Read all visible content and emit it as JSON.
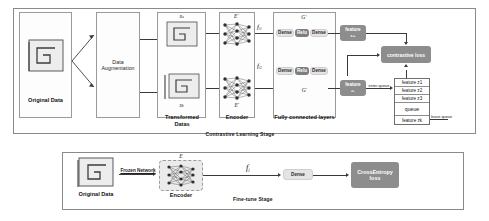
{
  "top_stage": {
    "stage_label": "Contrastive Learning Stage",
    "original_data_label": "Original Data",
    "augmentation_label_line1": "Data",
    "augmentation_label_line2": "Augmentation",
    "transformed_label_line1": "Transformed",
    "transformed_label_line2": "Datas",
    "sample_top_symbol": "x",
    "sample_top_subscript": "a",
    "sample_bottom_symbol": "x",
    "sample_bottom_subscript": "b",
    "encoder_label": "Encoder",
    "encoder_top_symbol": "E",
    "encoder_top_superscript": "+",
    "encoder_bottom_symbol": "E",
    "encoder_bottom_superscript": "-",
    "fc_label": "Fully connected layers",
    "head_top_symbol": "G",
    "head_top_superscript": "+",
    "head_bottom_symbol": "G",
    "head_bottom_superscript": "-",
    "feature_top_symbol": "f",
    "feature_top_subscript": "i1",
    "feature_bottom_symbol": "f",
    "feature_bottom_subscript": "i2",
    "mlp_top": [
      "Dense",
      "Relu",
      "Dense"
    ],
    "mlp_bottom": [
      "Dense",
      "Relu",
      "Dense"
    ],
    "feature_pos_line1": "feature",
    "feature_pos_line2": "z+",
    "feature_neg_line1": "feature",
    "feature_neg_line2": "z-",
    "loss_label": "contrastive loss",
    "enter_queue_label": "enter queue",
    "leave_queue_label": "leave queue",
    "queue_rows": [
      "feature z1",
      "feature z2",
      "feature z3"
    ],
    "queue_name": "queue",
    "queue_last": "feature zk"
  },
  "bottom_stage": {
    "stage_label": "Fine-tune Stage",
    "original_data_label": "Original Data",
    "frozen_label": "Frozen Network",
    "encoder_label": "Encoder",
    "encoder_symbol": "E",
    "feature_symbol": "f",
    "feature_subscript": "j",
    "dense_label": "Dense",
    "loss_line1": "CrossEntropy",
    "loss_line2": "loss"
  },
  "colors": {
    "pill_grey": "#8d8d8d",
    "pill_light": "#e4e4e4",
    "encoder_card": "#ebebeb",
    "line": "#3a3a3a",
    "border": "#8a8a8a"
  }
}
